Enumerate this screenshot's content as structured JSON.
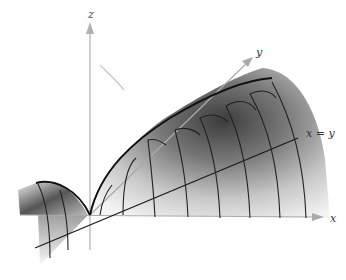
{
  "figure": {
    "type": "3d-surface-diagram",
    "axes": {
      "z_label": "z",
      "y_label": "y",
      "x_label": "x"
    },
    "line_label": "x = y",
    "colors": {
      "surface_dark": "#4a4a4a",
      "surface_light": "#f2f2f2",
      "curve": "#1a1a1a",
      "axis": "#aaaaaa"
    }
  }
}
